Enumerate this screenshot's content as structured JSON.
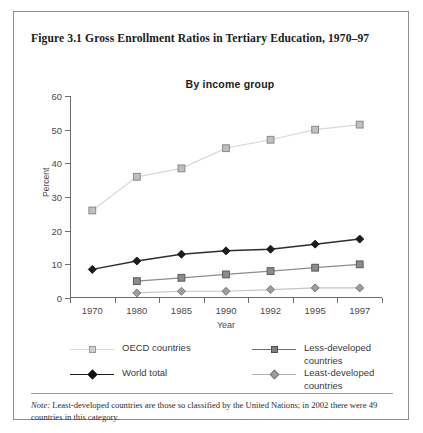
{
  "figure": {
    "title": "Figure 3.1 Gross Enrollment Ratios in Tertiary Education, 1970–97",
    "note_label": "Note:",
    "note_text": " Least-developed countries are those so classified by the United Nations; in 2002 there were 49 countries in this category."
  },
  "chart_data": {
    "type": "line",
    "title": "Figure 3.1 Gross Enrollment Ratios in Tertiary Education, 1970–97",
    "subtitle": "By income group",
    "xlabel": "Year",
    "ylabel": "Percent",
    "categories": [
      "1970",
      "1980",
      "1985",
      "1990",
      "1992",
      "1995",
      "1997"
    ],
    "ylim": [
      0,
      60
    ],
    "yticks": [
      0,
      10,
      20,
      30,
      40,
      50,
      60
    ],
    "grid": false,
    "legend_position": "below",
    "series": [
      {
        "name": "OECD countries",
        "marker": "square",
        "color": "#d9d9d9",
        "marker_fill": "#bfbfbf",
        "marker_stroke": "#8a8a8a",
        "values": [
          26,
          36,
          38.5,
          44.5,
          47,
          50,
          51.5
        ]
      },
      {
        "name": "Less-developed countries",
        "marker": "square",
        "color": "#8c8c8c",
        "marker_fill": "#8c8c8c",
        "marker_stroke": "#5a5a5a",
        "values": [
          null,
          5,
          6,
          7,
          8,
          9,
          10
        ]
      },
      {
        "name": "World total",
        "marker": "diamond",
        "color": "#2e2e2e",
        "marker_fill": "#1c1c1c",
        "marker_stroke": "#1c1c1c",
        "values": [
          8.5,
          11,
          13,
          14,
          14.5,
          16,
          17.5
        ]
      },
      {
        "name": "Least-developed countries",
        "marker": "diamond",
        "color": "#c4c4c4",
        "marker_fill": "#9e9e9e",
        "marker_stroke": "#7a7a7a",
        "values": [
          null,
          1.5,
          2,
          2,
          2.5,
          3,
          3
        ]
      }
    ]
  },
  "legend": {
    "entries": [
      {
        "label": "OECD countries",
        "marker": "square",
        "line_color": "#d9d9d9",
        "fill": "#cfcfcf",
        "stroke": "#9a9a9a"
      },
      {
        "label": "Less-developed countries",
        "marker": "square",
        "line_color": "#6f6f6f",
        "fill": "#7d7d7d",
        "stroke": "#4f4f4f"
      },
      {
        "label": "World total",
        "marker": "diamond",
        "line_color": "#1c1c1c",
        "fill": "#111111",
        "stroke": "#111111"
      },
      {
        "label": "Least-developed countries",
        "marker": "diamond",
        "line_color": "#b4b4b4",
        "fill": "#9e9e9e",
        "stroke": "#7a7a7a"
      }
    ]
  }
}
